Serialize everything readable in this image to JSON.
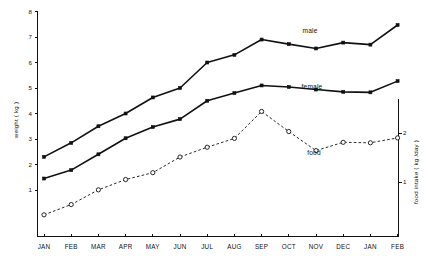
{
  "chart_data": {
    "type": "line",
    "title": "",
    "xlabel": "",
    "ylabel": "weight ( kg )",
    "y2label": "food  intake ( kg /day )",
    "categories": [
      "JAN",
      "FEB",
      "MAR",
      "APR",
      "MAY",
      "JUN",
      "JUL",
      "AUG",
      "SEP",
      "OCT",
      "NOV",
      "DEC",
      "JAN",
      "FEB"
    ],
    "ylim": [
      0,
      8
    ],
    "yticks": [
      1,
      2,
      3,
      4,
      5,
      6,
      7,
      8
    ],
    "y2lim": [
      0,
      2.8
    ],
    "y2ticks": [
      1,
      2
    ],
    "grid": false,
    "legend_position": "inline-annotations",
    "series": [
      {
        "name": "male",
        "axis": "left",
        "marker": "filled-square",
        "line": "solid",
        "values": [
          2.3,
          2.85,
          3.5,
          4.0,
          4.63,
          5.0,
          6.0,
          6.3,
          6.9,
          6.72,
          6.55,
          6.78,
          6.7,
          7.47
        ]
      },
      {
        "name": "female",
        "axis": "left",
        "marker": "filled-square",
        "line": "solid",
        "values": [
          1.45,
          1.78,
          2.4,
          3.03,
          3.47,
          3.78,
          4.5,
          4.8,
          5.1,
          5.04,
          4.94,
          4.85,
          4.83,
          5.27
        ]
      },
      {
        "name": "food",
        "axis": "right",
        "marker": "open-circle",
        "line": "dashed",
        "values": [
          0.33,
          0.54,
          0.84,
          1.05,
          1.19,
          1.51,
          1.71,
          1.89,
          2.44,
          2.03,
          1.64,
          1.81,
          1.8,
          1.9
        ]
      }
    ],
    "annotations": [
      {
        "text": "male",
        "series": "male",
        "x": "OCT"
      },
      {
        "text": "female",
        "series": "female",
        "x": "OCT"
      },
      {
        "text": "food",
        "series": "food",
        "x": "NOV"
      }
    ]
  },
  "axes": {
    "y_tick_labels": [
      "1",
      "2",
      "3",
      "4",
      "5",
      "6",
      "7",
      "8"
    ],
    "y2_tick_labels": [
      "1",
      "2"
    ],
    "x_tick_labels": [
      "JAN",
      "FEB",
      "MAR",
      "APR",
      "MAY",
      "JUN",
      "JUL",
      "AUG",
      "SEP",
      "OCT",
      "NOV",
      "DEC",
      "JAN",
      "FEB"
    ],
    "y_axis_title": "weight ( kg )",
    "y2_axis_title": "food  intake ( kg /day )"
  },
  "labels": {
    "male": "male",
    "female": "female",
    "food": "food"
  },
  "colors": {
    "ink": "#111111",
    "background": "#ffffff"
  }
}
